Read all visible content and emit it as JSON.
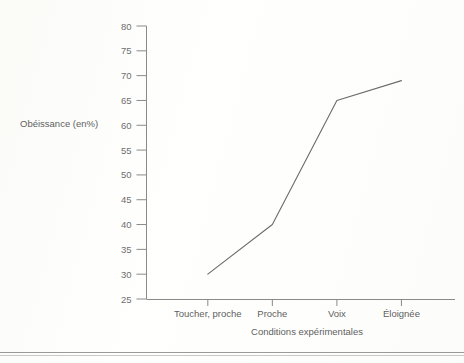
{
  "figure": {
    "background_color": "#fdfdfb",
    "ink_color": "#6b6b6b",
    "axis_color": "#8a8a8a"
  },
  "chart_data": {
    "type": "line",
    "title": "",
    "subtitle": "",
    "xlabel": "Conditions expérimentales",
    "ylabel": "Obéissance (en%)",
    "categories": [
      "Toucher, proche",
      "Proche",
      "Voix",
      "Éloignée"
    ],
    "values": [
      30,
      40,
      65,
      69
    ],
    "series": [
      {
        "name": "Obéissance",
        "values": [
          30,
          40,
          65,
          69
        ]
      }
    ],
    "ylim": [
      25,
      80
    ],
    "ytick_step": 5,
    "yticks": [
      25,
      30,
      35,
      40,
      45,
      50,
      55,
      60,
      65,
      70,
      75,
      80
    ],
    "ytick_labels": [
      "25",
      "30",
      "35",
      "40",
      "45",
      "50",
      "55",
      "60",
      "65",
      "70",
      "75",
      "80"
    ],
    "grid": false,
    "legend": false,
    "legend_position": "none",
    "markers": false,
    "annotations": []
  },
  "page": {
    "rule_note": ""
  }
}
